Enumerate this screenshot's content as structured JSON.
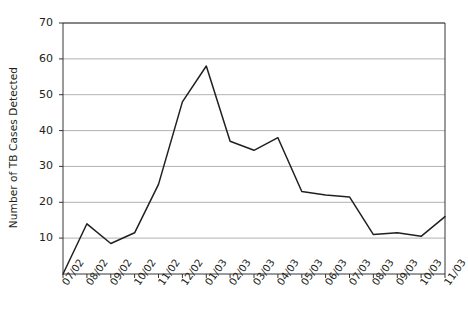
{
  "chart_data": {
    "type": "line",
    "title": "",
    "xlabel": "",
    "ylabel": "Number of TB Cases Detected",
    "categories": [
      "07/02",
      "08/02",
      "09/02",
      "10/02",
      "11/02",
      "12/02",
      "01/03",
      "02/03",
      "03/03",
      "04/03",
      "05/03",
      "06/03",
      "07/03",
      "08/03",
      "09/03",
      "10/03",
      "11/03"
    ],
    "values": [
      0,
      14,
      8.5,
      11.5,
      25,
      48,
      58,
      37,
      34.5,
      38,
      23,
      22,
      21.5,
      11,
      11.5,
      10.5,
      16
    ],
    "series": [
      {
        "name": "Number of TB Cases Detected",
        "values": [
          0,
          14,
          8.5,
          11.5,
          25,
          48,
          58,
          37,
          34.5,
          38,
          23,
          22,
          21.5,
          11,
          11.5,
          10.5,
          16
        ]
      }
    ],
    "ylim": [
      0,
      70
    ],
    "yticks": [
      10,
      20,
      30,
      40,
      50,
      60,
      70
    ],
    "ytick_labels": [
      "10",
      "20",
      "30",
      "40",
      "50",
      "60",
      "70"
    ],
    "grid": "horizontal",
    "legend": "none",
    "line_color": "#231f20",
    "grid_color": "#a7a9ac",
    "axis_color": "#231f20",
    "background": "#ffffff"
  },
  "axis": {
    "y_title": "Number of TB Cases Detected"
  }
}
